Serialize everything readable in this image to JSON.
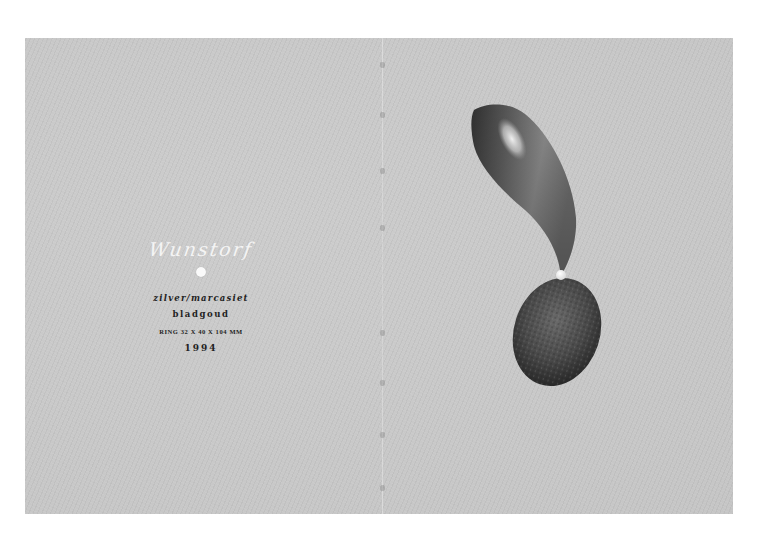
{
  "page": {
    "type": "catalogue-spread",
    "background_color": "#ffffff",
    "paper_color": "#c9c9c9"
  },
  "caption": {
    "title": "Wunstorf",
    "material": "zilver/marcasiet",
    "finish": "bladgoud",
    "dimensions": "RING 32 X 40 X 104 MM",
    "year": "1994"
  },
  "artwork": {
    "subject": "ring-sculpture",
    "parts": [
      {
        "name": "horn",
        "description": "curved tapering silver horn"
      },
      {
        "name": "pearl",
        "description": "small white bead at horn tip"
      },
      {
        "name": "stone",
        "description": "textured marcasite ovoid"
      }
    ],
    "colors": {
      "horn_dark": "#3a3a3a",
      "horn_mid": "#7a7a7a",
      "horn_highlight": "#e6e6e6",
      "stone_dark": "#2e2e2e",
      "stone_mid": "#5a5a5a",
      "pearl": "#fafafa"
    }
  },
  "binding": {
    "stitch_positions_y": [
      24,
      74,
      130,
      187,
      292,
      342,
      394,
      447
    ]
  }
}
